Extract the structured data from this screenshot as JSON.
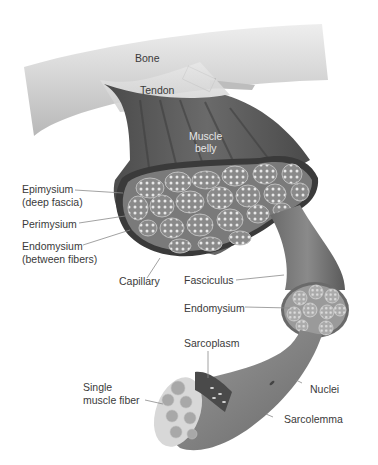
{
  "diagram": {
    "colors": {
      "background": "#ffffff",
      "bone": "#d6d6d6",
      "muscle": "#5a5a5a",
      "muscle_dark": "#3a3a3a",
      "fascicle_fill": "#9a9a9a",
      "fiber_dots": "#e8e8e8",
      "label_text": "#3a3a3a",
      "leader_line": "#8a8a8a"
    },
    "labels": {
      "bone": "Bone",
      "tendon": "Tendon",
      "muscle_belly_1": "Muscle",
      "muscle_belly_2": "belly",
      "epimysium_1": "Epimysium",
      "epimysium_2": "(deep fascia)",
      "perimysium": "Perimysium",
      "endomysium_1": "Endomysium",
      "endomysium_2": "(between fibers)",
      "capillary": "Capillary",
      "fasciculus": "Fasciculus",
      "endomysium_fascicle": "Endomysium",
      "sarcoplasm": "Sarcoplasm",
      "single_fiber_1": "Single",
      "single_fiber_2": "muscle fiber",
      "nuclei": "Nuclei",
      "sarcolemma": "Sarcolemma"
    }
  }
}
